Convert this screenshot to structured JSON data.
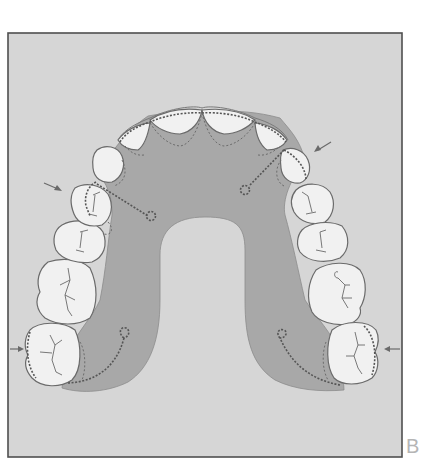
{
  "figure": {
    "panel_label": "B",
    "colors": {
      "background": "#d6d6d6",
      "frame": "#555555",
      "plate": "#a9a9a9",
      "tooth_fill": "#f1f1f1",
      "tooth_outline": "#6a6a6a",
      "wire": "#5a5a5a",
      "arrow": "#6a6a6a"
    },
    "elements": {
      "teeth_count": 14,
      "clasp_loops": 4,
      "arrows": 4
    }
  }
}
